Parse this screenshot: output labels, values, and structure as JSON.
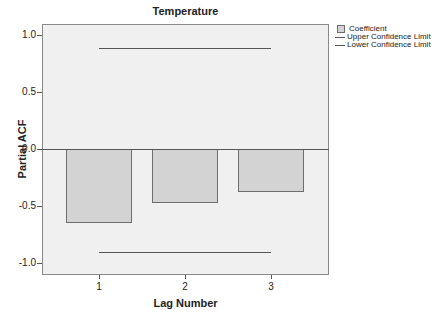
{
  "chart_data": {
    "type": "bar",
    "title": "Temperature",
    "xlabel": "Lag Number",
    "ylabel": "Partial ACF",
    "categories": [
      "1",
      "2",
      "3"
    ],
    "series": [
      {
        "name": "Coefficient",
        "values": [
          -0.65,
          -0.47,
          -0.38
        ]
      },
      {
        "name": "Upper Confidence Limit",
        "values": [
          0.89,
          0.89,
          0.89
        ]
      },
      {
        "name": "Lower Confidence Limit",
        "values": [
          -0.9,
          -0.9,
          -0.9
        ]
      }
    ],
    "ylim": [
      -1.1,
      1.1
    ],
    "yticks": [
      "1.0",
      "0.5",
      "0.0",
      "-0.5",
      "-1.0"
    ],
    "legend_position": "right",
    "grid": false
  },
  "colors": {
    "bar_fill": "#d3d3d3",
    "bar_border": "#6e6e6e",
    "plot_background": "#f0f0f0",
    "line": "#555555"
  },
  "legend": {
    "items": [
      {
        "label": "Coefficient",
        "type": "swatch"
      },
      {
        "label": "Upper Confidence Limit",
        "type": "line"
      },
      {
        "label": "Lower Confidence Limit",
        "type": "line"
      }
    ]
  }
}
